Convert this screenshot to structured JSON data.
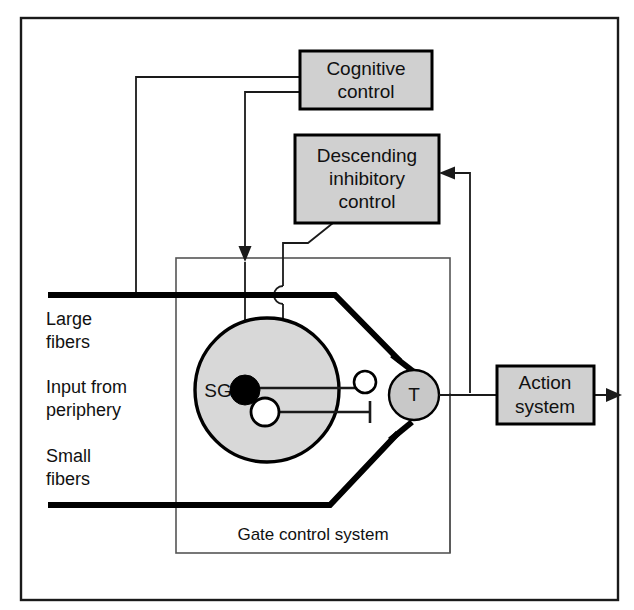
{
  "diagram": {
    "title": "Gate control system",
    "outer_frame": {
      "label": "outer-border"
    },
    "boxes": [
      {
        "id": "cognitive",
        "line1": "Cognitive",
        "line2": "control",
        "fill": "#d0d0d0",
        "stroke": "#000000"
      },
      {
        "id": "descending",
        "line1": "Descending",
        "line2": "inhibitory",
        "line3": "control",
        "fill": "#d0d0d0",
        "stroke": "#000000"
      },
      {
        "id": "action",
        "line1": "Action",
        "line2": "system",
        "fill": "#d0d0d0",
        "stroke": "#000000"
      }
    ],
    "side_labels": [
      {
        "id": "large",
        "line1": "Large",
        "line2": "fibers"
      },
      {
        "id": "input",
        "line1": "Input from",
        "line2": "periphery"
      },
      {
        "id": "small",
        "line1": "Small",
        "line2": "fibers"
      }
    ],
    "nodes": [
      {
        "id": "sg",
        "label": "SG",
        "fill": "#d8d8d8",
        "stroke": "#000000"
      },
      {
        "id": "t",
        "label": "T",
        "fill": "#c8c8c8",
        "stroke": "#000000"
      }
    ],
    "inner_box_label": "Gate control system",
    "colors": {
      "box_fill": "#d0d0d0",
      "sg_fill": "#d8d8d8",
      "t_fill": "#c8c8c8",
      "line": "#1a1a1a",
      "thick_line": "#000000",
      "background": "#ffffff"
    }
  }
}
